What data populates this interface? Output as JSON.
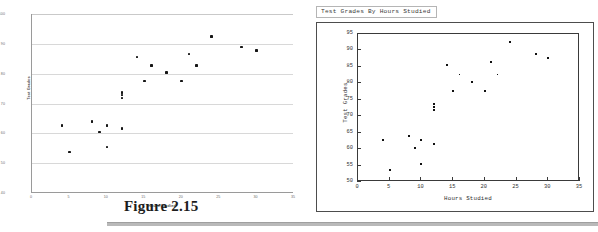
{
  "figure": {
    "caption": "Figure 2.15"
  },
  "chart_data": [
    {
      "id": "excel_scatter",
      "type": "scatter",
      "title": "",
      "xlabel": "Hours Studied",
      "ylabel": "Test Grades",
      "xlim": [
        0,
        35
      ],
      "ylim": [
        40,
        100
      ],
      "xticks": [
        0,
        5,
        10,
        15,
        20,
        25,
        30,
        35
      ],
      "yticks": [
        40,
        50,
        60,
        70,
        80,
        90,
        100
      ],
      "xtick_labels": [
        "0",
        "5",
        "10",
        "15",
        "20",
        "25",
        "30",
        "35"
      ],
      "ytick_labels": [
        "40",
        "50",
        "60",
        "70",
        "80",
        "90",
        "100"
      ],
      "grid": "horizontal",
      "legend": "none",
      "marker": "square",
      "marker_color": "#151515",
      "points": [
        {
          "x": 4,
          "y": 62.7
        },
        {
          "x": 5,
          "y": 53.7
        },
        {
          "x": 8,
          "y": 63.9
        },
        {
          "x": 9,
          "y": 60.4
        },
        {
          "x": 10,
          "y": 55.4
        },
        {
          "x": 10,
          "y": 62.7
        },
        {
          "x": 12,
          "y": 61.6
        },
        {
          "x": 12,
          "y": 71.9
        },
        {
          "x": 12,
          "y": 72.8
        },
        {
          "x": 12,
          "y": 73.7
        },
        {
          "x": 14,
          "y": 85.6
        },
        {
          "x": 15,
          "y": 77.6
        },
        {
          "x": 16,
          "y": 82.7
        },
        {
          "x": 18,
          "y": 80.4
        },
        {
          "x": 20,
          "y": 77.6
        },
        {
          "x": 21,
          "y": 86.6
        },
        {
          "x": 22,
          "y": 82.7
        },
        {
          "x": 24,
          "y": 92.5
        },
        {
          "x": 28,
          "y": 89.0
        },
        {
          "x": 30,
          "y": 87.8
        }
      ]
    },
    {
      "id": "matlab_scatter",
      "type": "scatter",
      "title": "Test Grades By Hours Studied",
      "xlabel": "Hours Studied",
      "ylabel": "Test Grades",
      "xlim": [
        0,
        35
      ],
      "ylim": [
        50,
        95
      ],
      "xticks": [
        0,
        5,
        10,
        15,
        20,
        25,
        30,
        35
      ],
      "yticks": [
        50,
        55,
        60,
        65,
        70,
        75,
        80,
        85,
        90,
        95
      ],
      "xtick_labels": [
        "0",
        "5",
        "10",
        "15",
        "20",
        "25",
        "30",
        "35"
      ],
      "ytick_labels": [
        "50",
        "55",
        "60",
        "65",
        "70",
        "75",
        "80",
        "85",
        "90",
        "95"
      ],
      "grid": "none",
      "legend": "none",
      "marker": "dot",
      "marker_color": "#111111",
      "points": [
        {
          "x": 4,
          "y": 62.7
        },
        {
          "x": 5,
          "y": 53.7
        },
        {
          "x": 8,
          "y": 63.9
        },
        {
          "x": 9,
          "y": 60.4
        },
        {
          "x": 10,
          "y": 55.4
        },
        {
          "x": 10,
          "y": 62.7
        },
        {
          "x": 12,
          "y": 61.6
        },
        {
          "x": 12,
          "y": 71.9
        },
        {
          "x": 12,
          "y": 72.8
        },
        {
          "x": 12,
          "y": 73.7
        },
        {
          "x": 14,
          "y": 85.6
        },
        {
          "x": 15,
          "y": 77.6
        },
        {
          "x": 16,
          "y": 82.7
        },
        {
          "x": 18,
          "y": 80.4
        },
        {
          "x": 20,
          "y": 77.6
        },
        {
          "x": 21,
          "y": 86.6
        },
        {
          "x": 22,
          "y": 82.7
        },
        {
          "x": 24,
          "y": 92.5
        },
        {
          "x": 28,
          "y": 89.0
        },
        {
          "x": 30,
          "y": 87.8
        }
      ]
    }
  ]
}
